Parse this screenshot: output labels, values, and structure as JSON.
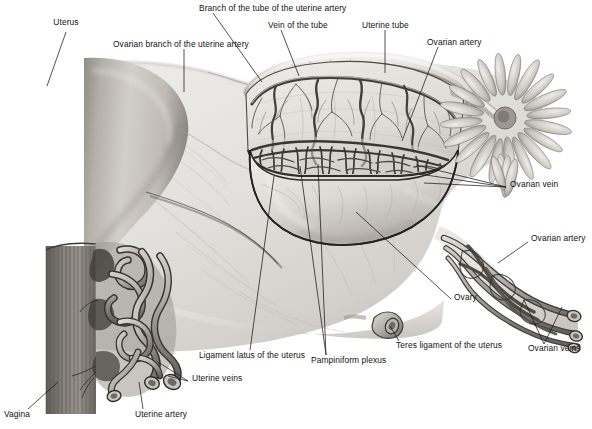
{
  "figure": {
    "domain": "anatomical-illustration",
    "width": 592,
    "height": 429,
    "background_color": "#ffffff",
    "ink_color": "#111111",
    "style": "grayscale halftone medical illustration"
  },
  "labels": [
    {
      "id": "uterus",
      "text": "Uterus",
      "x": 66,
      "y": 25,
      "align": "c",
      "leader": [
        [
          66,
          32
        ],
        [
          47,
          86
        ]
      ]
    },
    {
      "id": "ovarian-branch",
      "text": "Ovarian branch of the uterine artery",
      "x": 113,
      "y": 44,
      "align": "l",
      "leader": [
        [
          184,
          49
        ],
        [
          184,
          92
        ]
      ]
    },
    {
      "id": "branch-of-tube",
      "text": "Branch of the tube of the uterine artery",
      "x": 199,
      "y": 8,
      "align": "l",
      "leader": [
        [
          213,
          13
        ],
        [
          260,
          82
        ]
      ]
    },
    {
      "id": "vein-of-tube",
      "text": "Vein of the tube",
      "x": 268,
      "y": 25,
      "align": "l",
      "leader": [
        [
          281,
          30
        ],
        [
          299,
          75
        ]
      ]
    },
    {
      "id": "uterine-tube",
      "text": "Uterine tube",
      "x": 362,
      "y": 25,
      "align": "l",
      "leader": [
        [
          385,
          30
        ],
        [
          385,
          73
        ]
      ]
    },
    {
      "id": "ovarian-artery-top",
      "text": "Ovarian artery",
      "x": 427,
      "y": 42,
      "align": "l",
      "leader": [
        [
          438,
          47
        ],
        [
          402,
          140
        ]
      ]
    },
    {
      "id": "ovarian-vein",
      "text": "Ovarian vein",
      "x": 510,
      "y": 184,
      "align": "l",
      "leader": [
        [
          507,
          187
        ],
        [
          417,
          166
        ]
      ],
      "leader2": [
        [
          507,
          187
        ],
        [
          420,
          175
        ]
      ],
      "leader3": [
        [
          507,
          187
        ],
        [
          424,
          182
        ]
      ]
    },
    {
      "id": "ovarian-artery-right",
      "text": "Ovarian artery",
      "x": 531,
      "y": 238,
      "align": "l",
      "leader": [
        [
          529,
          242
        ],
        [
          500,
          262
        ]
      ]
    },
    {
      "id": "ovary",
      "text": "Ovary",
      "x": 454,
      "y": 296,
      "align": "l",
      "leader": [
        [
          452,
          299
        ],
        [
          355,
          212
        ]
      ]
    },
    {
      "id": "ovarian-veins",
      "text": "Ovarian veins",
      "x": 529,
      "y": 348,
      "align": "l",
      "leader": [
        [
          545,
          344
        ],
        [
          525,
          300
        ]
      ],
      "leader2": [
        [
          545,
          344
        ],
        [
          562,
          306
        ]
      ]
    },
    {
      "id": "teres-ligament",
      "text": "Teres ligament of the uterus",
      "x": 396,
      "y": 345,
      "align": "l",
      "leader": [
        [
          400,
          341
        ],
        [
          392,
          325
        ]
      ]
    },
    {
      "id": "pampiniform-plexus",
      "text": "Pampiniform plexus",
      "x": 311,
      "y": 360,
      "align": "l",
      "leader": [
        [
          327,
          355
        ],
        [
          301,
          165
        ]
      ],
      "leader2": [
        [
          327,
          355
        ],
        [
          318,
          163
        ]
      ]
    },
    {
      "id": "ligament-latus",
      "text": "Ligament latus of the uterus",
      "x": 199,
      "y": 355,
      "align": "l",
      "leader": [
        [
          250,
          350
        ],
        [
          273,
          176
        ]
      ]
    },
    {
      "id": "uterine-veins",
      "text": "Uterine veins",
      "x": 192,
      "y": 378,
      "align": "l",
      "leader": [
        [
          188,
          381
        ],
        [
          166,
          374
        ]
      ],
      "leader2": [
        [
          188,
          381
        ],
        [
          158,
          362
        ]
      ]
    },
    {
      "id": "uterine-artery",
      "text": "Uterine artery",
      "x": 135,
      "y": 414,
      "align": "l",
      "leader": [
        [
          143,
          409
        ],
        [
          140,
          382
        ]
      ]
    },
    {
      "id": "vagina",
      "text": "Vagina",
      "x": 4,
      "y": 414,
      "align": "l",
      "leader": [
        [
          28,
          409
        ],
        [
          56,
          382
        ]
      ]
    }
  ],
  "structures": {
    "uterus_body": "uterus-body",
    "broad_ligament": "broad-ligament-sheet",
    "uterine_tube": "uterine-tube-arc",
    "mesosalpinx_window": "mesosalpinx-vascular-window",
    "fimbriae": "fimbriae-fringe",
    "ovary": "ovary-body",
    "pampiniform_plexus": "pampiniform-plexus-coils",
    "ovarian_vessels": "ovarian-vessel-bundle",
    "uterine_vessels": "uterine-vessel-coils",
    "vagina_wall": "vagina-wall",
    "teres_ligament_stump": "teres-ligament-stump"
  },
  "palette": {
    "paper": "#ffffff",
    "tissue_light": "#e8e6e2",
    "tissue_mid": "#c9c5bf",
    "tissue_dark": "#9a958e",
    "tissue_shadow": "#6f6a64",
    "vessel_dark": "#4a4640",
    "vessel_mid": "#8d8880",
    "vessel_light": "#d5d1cb",
    "outline": "#3a3732",
    "label_text": "#111111",
    "leader_line": "#1a1a1a"
  }
}
